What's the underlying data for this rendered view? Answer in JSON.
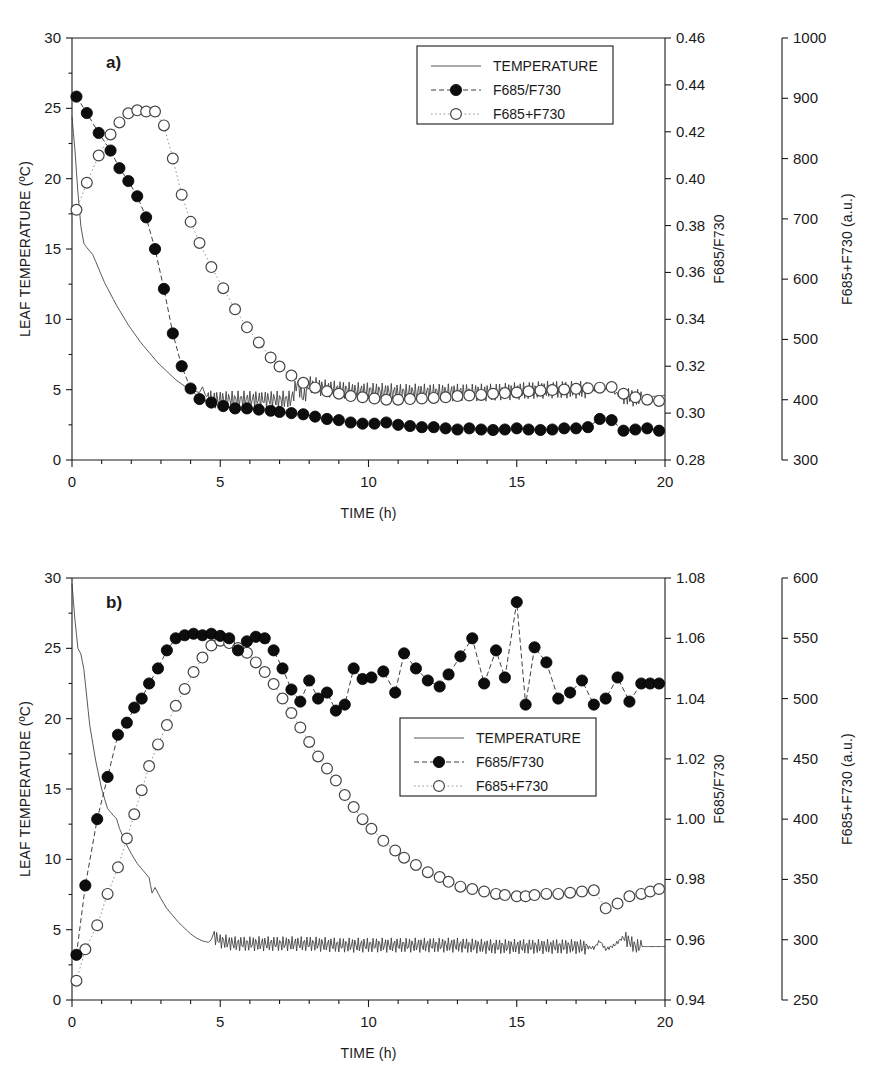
{
  "figure": {
    "top_header_fragment": "",
    "panels": [
      "a)",
      "b)"
    ]
  },
  "axis_titles": {
    "y_left": "LEAF TEMPERATURE (ºC)",
    "y_right1": "F685/F730",
    "y_right2": "F685+F730 (a.u.)",
    "x": "TIME (h)"
  },
  "legend": {
    "items": [
      {
        "label": "TEMPERATURE",
        "marker": "line"
      },
      {
        "label": "F685/F730",
        "marker": "filled-circle"
      },
      {
        "label": "F685+F730",
        "marker": "open-circle"
      }
    ]
  },
  "chart_data": [
    {
      "type": "line",
      "panel": "a)",
      "title": "",
      "xlabel": "TIME (h)",
      "ylabel": "LEAF TEMPERATURE (ºC)",
      "xlim": [
        0,
        20
      ],
      "ylim": [
        0,
        30
      ],
      "xticks": [
        0,
        5,
        10,
        15,
        20
      ],
      "yticks": [
        0,
        5,
        10,
        15,
        20,
        25,
        30
      ],
      "y2label": "F685/F730",
      "y2lim": [
        0.28,
        0.46
      ],
      "y2ticks": [
        0.28,
        0.3,
        0.32,
        0.34,
        0.36,
        0.38,
        0.4,
        0.42,
        0.44,
        0.46
      ],
      "y3label": "F685+F730 (a.u.)",
      "y3lim": [
        300,
        1000
      ],
      "y3ticks": [
        300,
        400,
        500,
        600,
        700,
        800,
        900,
        1000
      ],
      "grid": false,
      "legend_position": "top-right",
      "series": [
        {
          "name": "TEMPERATURE",
          "axis": "left",
          "unit": "ºC",
          "x": [
            0.0,
            0.1,
            0.2,
            0.3,
            0.4,
            0.5,
            0.7,
            0.9,
            1.1,
            1.3,
            1.5,
            1.7,
            1.9,
            2.1,
            2.3,
            2.5,
            2.7,
            2.9,
            3.1,
            3.3,
            3.5,
            3.7,
            3.9,
            4.1,
            4.3,
            4.4,
            4.5,
            4.6,
            4.8,
            5.0,
            5.4,
            5.8,
            6.2,
            6.6,
            7.0,
            7.4,
            7.6,
            7.8,
            8.0,
            8.5,
            9.0,
            9.5,
            10.0,
            11.0,
            12.0,
            13.0,
            14.0,
            15.0,
            16.0,
            17.0,
            17.5,
            18.0,
            18.5,
            19.0,
            19.5,
            20.0
          ],
          "y": [
            24.4,
            22.0,
            19.0,
            16.6,
            15.4,
            15.1,
            14.6,
            13.6,
            12.6,
            11.8,
            11.0,
            10.3,
            9.6,
            9.0,
            8.4,
            7.9,
            7.4,
            6.9,
            6.5,
            6.1,
            5.7,
            5.4,
            5.1,
            4.9,
            4.8,
            5.2,
            4.6,
            4.4,
            4.3,
            4.3,
            4.3,
            4.3,
            4.3,
            4.3,
            4.3,
            4.3,
            5.5,
            4.4,
            5.4,
            5.1,
            5.0,
            4.9,
            4.9,
            4.8,
            4.8,
            4.8,
            4.8,
            4.9,
            5.0,
            5.0,
            5.0,
            5.1,
            4.6,
            4.4,
            4.5,
            4.6
          ],
          "note": "Rapid cooling then stable near 4.5 ºC with regular oscillation after t≈4.5 h"
        },
        {
          "name": "F685/F730",
          "axis": "right1",
          "x": [
            0.15,
            0.5,
            0.9,
            1.3,
            1.6,
            1.9,
            2.2,
            2.5,
            2.8,
            3.1,
            3.4,
            3.7,
            4.0,
            4.3,
            4.7,
            5.1,
            5.5,
            5.9,
            6.3,
            6.7,
            7.0,
            7.4,
            7.8,
            8.2,
            8.6,
            9.0,
            9.4,
            9.8,
            10.2,
            10.6,
            11.0,
            11.4,
            11.8,
            12.2,
            12.6,
            13.0,
            13.4,
            13.8,
            14.2,
            14.6,
            15.0,
            15.4,
            15.8,
            16.2,
            16.6,
            17.0,
            17.4,
            17.8,
            18.2,
            18.6,
            19.0,
            19.4,
            19.8
          ],
          "y": [
            0.435,
            0.428,
            0.4195,
            0.412,
            0.4045,
            0.399,
            0.3925,
            0.3835,
            0.37,
            0.353,
            0.334,
            0.32,
            0.3105,
            0.306,
            0.3045,
            0.303,
            0.302,
            0.302,
            0.3015,
            0.301,
            0.3005,
            0.3,
            0.2995,
            0.2985,
            0.2975,
            0.297,
            0.296,
            0.2955,
            0.2955,
            0.296,
            0.295,
            0.2945,
            0.294,
            0.294,
            0.2935,
            0.293,
            0.2935,
            0.293,
            0.2928,
            0.293,
            0.2935,
            0.293,
            0.2928,
            0.293,
            0.2935,
            0.2935,
            0.294,
            0.2975,
            0.297,
            0.2925,
            0.293,
            0.2935,
            0.2925
          ],
          "note": "Monotonic decline from ~0.435 to plateau ~0.293"
        },
        {
          "name": "F685+F730",
          "axis": "right2",
          "unit": "a.u.",
          "x": [
            0.15,
            0.5,
            0.9,
            1.3,
            1.6,
            1.9,
            2.2,
            2.5,
            2.8,
            3.1,
            3.4,
            3.7,
            4.0,
            4.3,
            4.7,
            5.1,
            5.5,
            5.9,
            6.3,
            6.7,
            7.0,
            7.4,
            7.8,
            8.2,
            8.6,
            9.0,
            9.4,
            9.8,
            10.2,
            10.6,
            11.0,
            11.4,
            11.8,
            12.2,
            12.6,
            13.0,
            13.4,
            13.8,
            14.2,
            14.6,
            15.0,
            15.4,
            15.8,
            16.2,
            16.6,
            17.0,
            17.4,
            17.8,
            18.2,
            18.6,
            19.0,
            19.4,
            19.8
          ],
          "y": [
            715,
            760,
            805,
            840,
            860,
            875,
            880,
            878,
            878,
            855,
            800,
            740,
            695,
            660,
            620,
            585,
            550,
            520,
            495,
            470,
            455,
            440,
            428,
            420,
            414,
            410,
            406,
            404,
            402,
            400,
            400,
            401,
            402,
            403,
            404,
            406,
            407,
            408,
            410,
            411,
            412,
            414,
            415,
            416,
            417,
            418,
            419,
            420,
            421,
            410,
            404,
            400,
            398
          ],
          "note": "Rises to maximum ~880 a.u. near t≈2.3 h then decays to ~400 a.u. plateau"
        }
      ]
    },
    {
      "type": "line",
      "panel": "b)",
      "title": "",
      "xlabel": "TIME (h)",
      "ylabel": "LEAF TEMPERATURE (ºC)",
      "xlim": [
        0,
        20
      ],
      "ylim": [
        0,
        30
      ],
      "xticks": [
        0,
        5,
        10,
        15,
        20
      ],
      "yticks": [
        0,
        5,
        10,
        15,
        20,
        25,
        30
      ],
      "y2label": "F685/F730",
      "y2lim": [
        0.94,
        1.08
      ],
      "y2ticks": [
        0.94,
        0.96,
        0.98,
        1.0,
        1.02,
        1.04,
        1.06,
        1.08
      ],
      "y3label": "F685+F730 (a.u.)",
      "y3lim": [
        250,
        600
      ],
      "y3ticks": [
        250,
        300,
        350,
        400,
        450,
        500,
        550,
        600
      ],
      "grid": false,
      "legend_position": "center-right",
      "series": [
        {
          "name": "TEMPERATURE",
          "axis": "left",
          "unit": "ºC",
          "x": [
            0.0,
            0.1,
            0.2,
            0.3,
            0.4,
            0.5,
            0.6,
            0.8,
            1.0,
            1.2,
            1.4,
            1.5,
            1.6,
            1.8,
            2.0,
            2.2,
            2.4,
            2.6,
            2.7,
            2.8,
            3.0,
            3.2,
            3.4,
            3.6,
            3.8,
            4.0,
            4.2,
            4.4,
            4.6,
            4.8,
            5.0,
            5.5,
            6.0,
            6.5,
            7.0,
            7.5,
            8.0,
            9.0,
            10.0,
            11.0,
            12.0,
            13.0,
            14.0,
            15.0,
            16.0,
            17.0,
            17.6,
            17.8,
            18.0,
            18.3,
            18.6,
            19.0,
            19.3,
            19.6,
            20.0
          ],
          "y": [
            29.6,
            27.0,
            25.0,
            24.6,
            23.5,
            21.5,
            19.5,
            17.0,
            15.0,
            13.6,
            13.1,
            12.9,
            12.2,
            11.2,
            10.4,
            9.7,
            9.2,
            8.7,
            7.6,
            8.0,
            7.2,
            6.5,
            6.0,
            5.5,
            5.1,
            4.7,
            4.4,
            4.2,
            4.1,
            4.5,
            4.2,
            4.0,
            4.0,
            4.0,
            4.0,
            4.0,
            4.0,
            3.9,
            3.9,
            3.9,
            3.9,
            3.9,
            3.8,
            3.8,
            3.8,
            3.8,
            3.7,
            4.2,
            3.6,
            3.9,
            4.5,
            3.8,
            3.8,
            3.8,
            3.8
          ],
          "note": "Cooling from ~29.6 ºC to stable ~4 ºC with oscillation after t≈4.6 h"
        },
        {
          "name": "F685/F730",
          "axis": "right1",
          "x": [
            0.15,
            0.45,
            0.85,
            1.2,
            1.55,
            1.85,
            2.1,
            2.35,
            2.6,
            2.9,
            3.2,
            3.5,
            3.8,
            4.1,
            4.4,
            4.7,
            5.0,
            5.3,
            5.6,
            5.9,
            6.2,
            6.5,
            6.8,
            7.1,
            7.4,
            7.7,
            8.0,
            8.3,
            8.6,
            8.9,
            9.2,
            9.5,
            9.8,
            10.1,
            10.5,
            10.9,
            11.2,
            11.6,
            12.0,
            12.4,
            12.7,
            13.1,
            13.5,
            13.9,
            14.3,
            14.6,
            15.0,
            15.3,
            15.6,
            16.0,
            16.4,
            16.8,
            17.2,
            17.6,
            18.0,
            18.4,
            18.8,
            19.2,
            19.5,
            19.8
          ],
          "y": [
            0.955,
            0.978,
            1.0,
            1.014,
            1.028,
            1.032,
            1.037,
            1.04,
            1.045,
            1.05,
            1.056,
            1.06,
            1.061,
            1.0615,
            1.061,
            1.0615,
            1.0608,
            1.06,
            1.056,
            1.059,
            1.0605,
            1.06,
            1.056,
            1.05,
            1.043,
            1.039,
            1.046,
            1.04,
            1.042,
            1.036,
            1.038,
            1.05,
            1.0465,
            1.047,
            1.049,
            1.042,
            1.055,
            1.05,
            1.046,
            1.044,
            1.048,
            1.054,
            1.06,
            1.045,
            1.056,
            1.047,
            1.072,
            1.038,
            1.057,
            1.052,
            1.04,
            1.042,
            1.046,
            1.038,
            1.04,
            1.047,
            1.039,
            1.045,
            1.045,
            1.045
          ],
          "note": "Rises from ~0.955 to a plateau near 1.06 with strong scatter; maximum spike 1.072 at t≈15 h"
        },
        {
          "name": "F685+F730",
          "axis": "right2",
          "unit": "a.u.",
          "x": [
            0.15,
            0.45,
            0.85,
            1.2,
            1.55,
            1.85,
            2.1,
            2.35,
            2.6,
            2.9,
            3.2,
            3.5,
            3.8,
            4.1,
            4.4,
            4.7,
            5.0,
            5.3,
            5.6,
            5.9,
            6.2,
            6.5,
            6.8,
            7.1,
            7.4,
            7.7,
            8.0,
            8.3,
            8.6,
            8.9,
            9.2,
            9.5,
            9.8,
            10.1,
            10.5,
            10.9,
            11.2,
            11.6,
            12.0,
            12.4,
            12.7,
            13.1,
            13.5,
            13.9,
            14.3,
            14.6,
            15.0,
            15.3,
            15.6,
            16.0,
            16.4,
            16.8,
            17.2,
            17.6,
            18.0,
            18.4,
            18.8,
            19.2,
            19.5,
            19.8
          ],
          "y": [
            266,
            292,
            312,
            338,
            360,
            384,
            404,
            424,
            444,
            462,
            478,
            494,
            508,
            522,
            534,
            544,
            548,
            546,
            542,
            538,
            530,
            522,
            512,
            500,
            488,
            476,
            464,
            452,
            442,
            432,
            420,
            410,
            400,
            392,
            382,
            374,
            368,
            362,
            356,
            352,
            348,
            344,
            342,
            340,
            338,
            337,
            336,
            336,
            337,
            338,
            338,
            339,
            340,
            341,
            326,
            330,
            336,
            338,
            340,
            342
          ],
          "note": "Rises to peak ~548 a.u. near t≈5 h then decays to ~336 a.u. plateau"
        }
      ]
    }
  ]
}
